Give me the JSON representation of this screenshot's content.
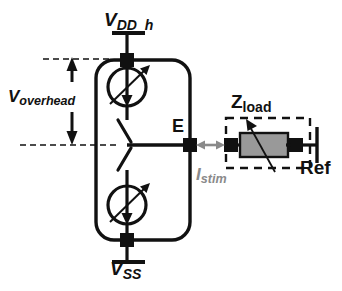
{
  "figure": {
    "type": "circuit-schematic",
    "width": 342,
    "height": 291,
    "background_color": "#ffffff"
  },
  "labels": {
    "supply_top": {
      "base": "V",
      "sub": "DD_h",
      "text": "V_DD_h"
    },
    "supply_bottom": {
      "base": "V",
      "sub": "SS",
      "text": "V_SS"
    },
    "overhead": {
      "base": "V",
      "sub": "overhead",
      "text": "V_overhead"
    },
    "electrode_node": {
      "text": "E"
    },
    "load": {
      "base": "Z",
      "sub": "load",
      "text": "Z_load"
    },
    "reference": {
      "text": "Ref"
    },
    "stim_current": {
      "base": "I",
      "sub": "stim",
      "text": "I_stim"
    }
  },
  "components": {
    "source_top": {
      "name": "variable-current-source-top",
      "symbol": "circle-with-down-arrow-and-diagonal",
      "center": [
        127,
        87
      ],
      "radius": 19
    },
    "source_bottom": {
      "name": "variable-current-source-bottom",
      "symbol": "circle-with-down-arrow-and-diagonal",
      "center": [
        127,
        205
      ],
      "radius": 19
    },
    "switch": {
      "name": "spdt-switch",
      "symbol": "two-throw-selector",
      "position": [
        127,
        145
      ]
    },
    "load_impedance": {
      "name": "load-impedance-block",
      "symbol": "variable-resistor-shaded",
      "rect": [
        240,
        133,
        48,
        24
      ],
      "fill": "#999999"
    },
    "dashed_box": {
      "name": "z-load-boundary",
      "rect": [
        226,
        118,
        84,
        50
      ]
    },
    "pads": [
      {
        "name": "pad-vdd",
        "x": 127,
        "y": 60
      },
      {
        "name": "pad-vss",
        "x": 127,
        "y": 240
      },
      {
        "name": "pad-electrode",
        "x": 190,
        "y": 145
      },
      {
        "name": "pad-load-left",
        "x": 231,
        "y": 145
      },
      {
        "name": "pad-load-right",
        "x": 296,
        "y": 145
      }
    ],
    "current_arrow": {
      "name": "istim-arrow",
      "from": [
        196,
        145
      ],
      "to": [
        224,
        145
      ],
      "color": "#8a8a8a",
      "double_headed": true
    }
  },
  "colors": {
    "line": "#111111",
    "gray_accent": "#8a8a8a",
    "load_fill": "#999999",
    "dashed": "#111111"
  }
}
